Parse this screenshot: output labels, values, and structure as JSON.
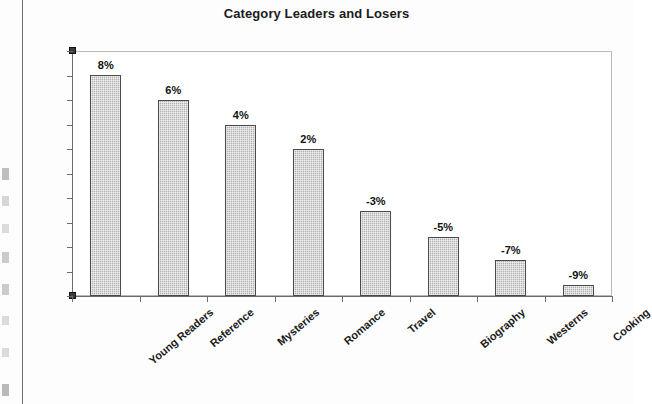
{
  "chart_data": {
    "type": "bar",
    "title": "Category Leaders and Losers",
    "xlabel": "",
    "ylabel": "",
    "categories": [
      "Young Readers",
      "Reference",
      "Mysteries",
      "Romance",
      "Travel",
      "Biography",
      "Westerns",
      "Cooking"
    ],
    "values": [
      8,
      6,
      4,
      2,
      -3,
      -5,
      -7,
      -9
    ],
    "data_labels": [
      "8%",
      "6%",
      "4%",
      "2%",
      "-3%",
      "-5%",
      "-7%",
      "-9%"
    ],
    "bar_pixel_heights": [
      221,
      196,
      171,
      147,
      85,
      59,
      36,
      11
    ],
    "grid": false,
    "legend": null,
    "y_axis_tick_count": 11,
    "y_axis_tick_labels": [],
    "colors": {
      "bar_fill": "#b0b0b0",
      "bar_border": "#4a4a4a",
      "axis": "#6b6b6b",
      "frame": "#b9b9b9",
      "text": "#111111",
      "background": "#ffffff"
    }
  },
  "page": {
    "border_line": "page-edge-rule"
  }
}
